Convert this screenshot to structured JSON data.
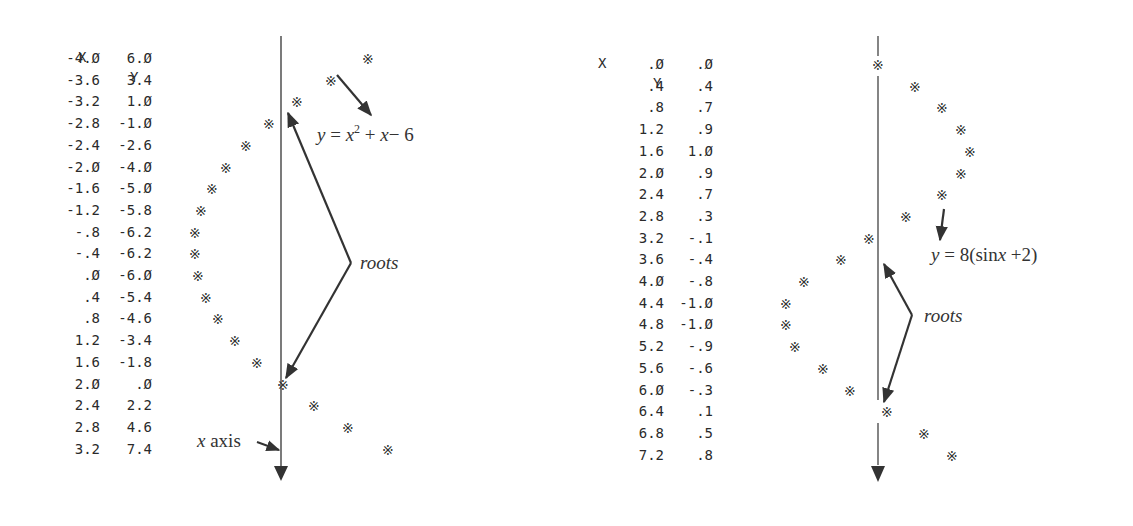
{
  "chart_data": [
    {
      "type": "scatter",
      "title": "",
      "equation_label": "y = x² + x − 6",
      "annotation_roots": "roots",
      "annotation_axis": "x axis",
      "table_headers": [
        "X",
        "Y"
      ],
      "x": [
        "-4.0",
        "-3.6",
        "-3.2",
        "-2.8",
        "-2.4",
        "-2.0",
        "-1.6",
        "-1.2",
        "-.8",
        "-.4",
        ".0",
        ".4",
        ".8",
        "1.2",
        "1.6",
        "2.0",
        "2.4",
        "2.8",
        "3.2"
      ],
      "y": [
        "6.0",
        "3.4",
        "1.0",
        "-1.0",
        "-2.6",
        "-4.0",
        "-5.0",
        "-5.8",
        "-6.2",
        "-6.2",
        "-6.0",
        "-5.4",
        "-4.6",
        "-3.4",
        "-1.8",
        ".0",
        "2.2",
        "4.6",
        "7.4"
      ],
      "x_values": [
        -4.0,
        -3.6,
        -3.2,
        -2.8,
        -2.4,
        -2.0,
        -1.6,
        -1.2,
        -0.8,
        -0.4,
        0.0,
        0.4,
        0.8,
        1.2,
        1.6,
        2.0,
        2.4,
        2.8,
        3.2
      ],
      "y_values": [
        6.0,
        3.4,
        1.0,
        -1.0,
        -2.6,
        -4.0,
        -5.0,
        -5.8,
        -6.2,
        -6.2,
        -6.0,
        -5.4,
        -4.6,
        -3.4,
        -1.8,
        0.0,
        2.2,
        4.6,
        7.4
      ],
      "orientation": "x axis vertical (downward), y horizontal",
      "marker": "*"
    },
    {
      "type": "scatter",
      "title": "",
      "equation_label": "y = 8(sin x + 2)",
      "annotation_roots": "roots",
      "table_headers": [
        "X",
        "Y"
      ],
      "x": [
        ".0",
        ".4",
        ".8",
        "1.2",
        "1.6",
        "2.0",
        "2.4",
        "2.8",
        "3.2",
        "3.6",
        "4.0",
        "4.4",
        "4.8",
        "5.2",
        "5.6",
        "6.0",
        "6.4",
        "6.8",
        "7.2"
      ],
      "y": [
        ".0",
        ".4",
        ".7",
        ".9",
        "1.0",
        ".9",
        ".7",
        ".3",
        "-.1",
        "-.4",
        "-.8",
        "-1.0",
        "-1.0",
        "-.9",
        "-.6",
        "-.3",
        ".1",
        ".5",
        ".8"
      ],
      "x_values": [
        0.0,
        0.4,
        0.8,
        1.2,
        1.6,
        2.0,
        2.4,
        2.8,
        3.2,
        3.6,
        4.0,
        4.4,
        4.8,
        5.2,
        5.6,
        6.0,
        6.4,
        6.8,
        7.2
      ],
      "y_values": [
        0.0,
        0.4,
        0.7,
        0.9,
        1.0,
        0.9,
        0.7,
        0.3,
        -0.1,
        -0.4,
        -0.8,
        -1.0,
        -1.0,
        -0.9,
        -0.6,
        -0.3,
        0.1,
        0.5,
        0.8
      ],
      "orientation": "x axis vertical (downward), y horizontal",
      "marker": "*"
    }
  ],
  "left": {
    "header_x": "X",
    "header_y": "Y",
    "equation": "y = x² + x − 6",
    "roots_label": "roots",
    "axis_label": "x axis",
    "rows": [
      {
        "x": "-4.0",
        "y": "6.0"
      },
      {
        "x": "-3.6",
        "y": "3.4"
      },
      {
        "x": "-3.2",
        "y": "1.0"
      },
      {
        "x": "-2.8",
        "y": "-1.0"
      },
      {
        "x": "-2.4",
        "y": "-2.6"
      },
      {
        "x": "-2.0",
        "y": "-4.0"
      },
      {
        "x": "-1.6",
        "y": "-5.0"
      },
      {
        "x": "-1.2",
        "y": "-5.8"
      },
      {
        "x": "-.8",
        "y": "-6.2"
      },
      {
        "x": "-.4",
        "y": "-6.2"
      },
      {
        "x": ".0",
        "y": "-6.0"
      },
      {
        "x": ".4",
        "y": "-5.4"
      },
      {
        "x": ".8",
        "y": "-4.6"
      },
      {
        "x": "1.2",
        "y": "-3.4"
      },
      {
        "x": "1.6",
        "y": "-1.8"
      },
      {
        "x": "2.0",
        "y": ".0"
      },
      {
        "x": "2.4",
        "y": "2.2"
      },
      {
        "x": "2.8",
        "y": "4.6"
      },
      {
        "x": "3.2",
        "y": "7.4"
      }
    ]
  },
  "right": {
    "header_x": "X",
    "header_y": "Y",
    "equation": "y = 8(sin x + 2)",
    "roots_label": "roots",
    "rows": [
      {
        "x": ".0",
        "y": ".0"
      },
      {
        "x": ".4",
        "y": ".4"
      },
      {
        "x": ".8",
        "y": ".7"
      },
      {
        "x": "1.2",
        "y": ".9"
      },
      {
        "x": "1.6",
        "y": "1.0"
      },
      {
        "x": "2.0",
        "y": ".9"
      },
      {
        "x": "2.4",
        "y": ".7"
      },
      {
        "x": "2.8",
        "y": ".3"
      },
      {
        "x": "3.2",
        "y": "-.1"
      },
      {
        "x": "3.6",
        "y": "-.4"
      },
      {
        "x": "4.0",
        "y": "-.8"
      },
      {
        "x": "4.4",
        "y": "-1.0"
      },
      {
        "x": "4.8",
        "y": "-1.0"
      },
      {
        "x": "5.2",
        "y": "-.9"
      },
      {
        "x": "5.6",
        "y": "-.6"
      },
      {
        "x": "6.0",
        "y": "-.3"
      },
      {
        "x": "6.4",
        "y": ".1"
      },
      {
        "x": "6.8",
        "y": ".5"
      },
      {
        "x": "7.2",
        "y": ".8"
      }
    ]
  },
  "colors": {
    "ink": "#333333",
    "background": "#ffffff"
  }
}
